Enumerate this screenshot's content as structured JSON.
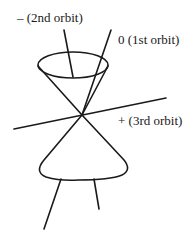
{
  "diagram": {
    "labels": {
      "second_orbit": "– (2nd orbit)",
      "first_orbit": "0 (1st orbit)",
      "third_orbit": "+ (3rd orbit)"
    },
    "colors": {
      "ink": "#1a1a1a",
      "background": "#ffffff"
    }
  }
}
